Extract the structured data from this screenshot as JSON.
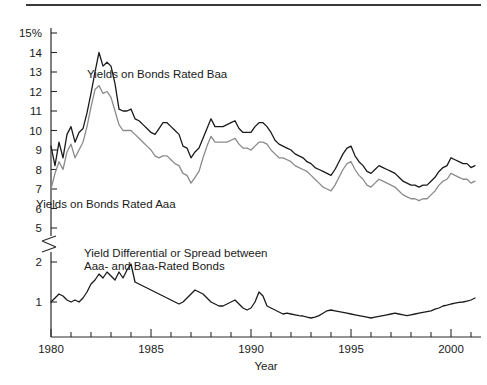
{
  "chart_data": {
    "type": "line",
    "title": "",
    "xlabel": "Year",
    "ylabel": "",
    "grid": false,
    "legend_position": "inline-annotations",
    "x_ticks_labeled": [
      "1980",
      "1985",
      "1990",
      "1995",
      "2000"
    ],
    "x_tick_values": [
      1980,
      1985,
      1990,
      1995,
      2000
    ],
    "xlim": [
      1980,
      2001.5
    ],
    "x_minor_ticks_every": 1,
    "y_upper_ticks": [
      "15%",
      "14",
      "13",
      "12",
      "11",
      "10",
      "9",
      "8",
      "7",
      "6",
      "5"
    ],
    "y_upper_tick_values": [
      15,
      14,
      13,
      12,
      11,
      10,
      9,
      8,
      7,
      6,
      5
    ],
    "y_lower_ticks": [
      "2",
      "1"
    ],
    "y_lower_tick_values": [
      2,
      1
    ],
    "axis_break": true,
    "axis_break_note": "y-axis broken between 5 and 2",
    "ylim_upper": [
      5,
      15
    ],
    "ylim_lower": [
      0,
      2.3
    ],
    "annotations": [
      {
        "id": "baa-label",
        "text": "Yields on Bonds Rated Baa",
        "x": 87,
        "y": 78
      },
      {
        "id": "aaa-label",
        "text": "Yields on Bonds Rated Aaa",
        "x": 36,
        "y": 208
      },
      {
        "id": "spread-label-line1",
        "text": "Yield Differential or Spread between",
        "x": 84,
        "y": 257
      },
      {
        "id": "spread-label-line2",
        "text": "Aaa- and Baa-Rated Bonds",
        "x": 84,
        "y": 270
      }
    ],
    "colors": {
      "baa": "#1a1a1a",
      "aaa": "#8a8a8a",
      "spread": "#1a1a1a",
      "axis": "#2b2b2b",
      "background": "#ffffff"
    },
    "series": [
      {
        "name": "Yields on Bonds Rated Baa",
        "color": "#1a1a1a",
        "axis": "upper",
        "x": [
          1980.0,
          1980.2,
          1980.4,
          1980.6,
          1980.8,
          1981.0,
          1981.2,
          1981.4,
          1981.6,
          1981.8,
          1982.0,
          1982.2,
          1982.4,
          1982.6,
          1982.8,
          1983.0,
          1983.2,
          1983.4,
          1983.6,
          1983.8,
          1984.0,
          1984.2,
          1984.4,
          1984.6,
          1984.8,
          1985.0,
          1985.2,
          1985.4,
          1985.6,
          1985.8,
          1986.0,
          1986.2,
          1986.4,
          1986.6,
          1986.8,
          1987.0,
          1987.2,
          1987.4,
          1987.6,
          1987.8,
          1988.0,
          1988.2,
          1988.4,
          1988.6,
          1988.8,
          1989.0,
          1989.2,
          1989.4,
          1989.6,
          1989.8,
          1990.0,
          1990.2,
          1990.4,
          1990.6,
          1990.8,
          1991.0,
          1991.2,
          1991.4,
          1991.6,
          1991.8,
          1992.0,
          1992.2,
          1992.4,
          1992.6,
          1992.8,
          1993.0,
          1993.2,
          1993.4,
          1993.6,
          1993.8,
          1994.0,
          1994.2,
          1994.4,
          1994.6,
          1994.8,
          1995.0,
          1995.2,
          1995.4,
          1995.6,
          1995.8,
          1996.0,
          1996.2,
          1996.4,
          1996.6,
          1996.8,
          1997.0,
          1997.2,
          1997.4,
          1997.6,
          1997.8,
          1998.0,
          1998.2,
          1998.4,
          1998.6,
          1998.8,
          1999.0,
          1999.2,
          1999.4,
          1999.6,
          1999.8,
          2000.0,
          2000.2,
          2000.4,
          2000.6,
          2000.8,
          2001.0,
          2001.2
        ],
        "y": [
          9.2,
          8.2,
          9.4,
          8.6,
          9.8,
          10.2,
          9.4,
          9.9,
          10.1,
          10.9,
          11.9,
          13.0,
          14.0,
          13.3,
          13.5,
          13.3,
          12.4,
          11.1,
          11.0,
          11.0,
          11.1,
          10.6,
          10.5,
          10.3,
          10.1,
          9.9,
          9.8,
          10.1,
          10.4,
          10.4,
          10.2,
          10.0,
          9.8,
          9.2,
          9.1,
          8.6,
          8.9,
          9.1,
          9.6,
          10.1,
          10.6,
          10.2,
          10.2,
          10.2,
          10.3,
          10.4,
          10.5,
          10.1,
          9.9,
          9.9,
          9.9,
          10.2,
          10.4,
          10.4,
          10.2,
          9.9,
          9.5,
          9.3,
          9.2,
          9.1,
          9.0,
          8.8,
          8.7,
          8.6,
          8.4,
          8.3,
          8.1,
          8.0,
          7.9,
          7.8,
          7.7,
          8.0,
          8.4,
          8.8,
          9.1,
          9.2,
          8.7,
          8.4,
          8.2,
          7.9,
          7.8,
          8.0,
          8.2,
          8.1,
          8.0,
          7.9,
          7.8,
          7.6,
          7.4,
          7.3,
          7.2,
          7.2,
          7.1,
          7.2,
          7.2,
          7.4,
          7.6,
          7.9,
          8.1,
          8.2,
          8.6,
          8.5,
          8.4,
          8.3,
          8.3,
          8.1,
          8.2
        ],
        "unit": "percent"
      },
      {
        "name": "Yields on Bonds Rated Aaa",
        "color": "#8a8a8a",
        "axis": "upper",
        "x": [
          1980.0,
          1980.2,
          1980.4,
          1980.6,
          1980.8,
          1981.0,
          1981.2,
          1981.4,
          1981.6,
          1981.8,
          1982.0,
          1982.2,
          1982.4,
          1982.6,
          1982.8,
          1983.0,
          1983.2,
          1983.4,
          1983.6,
          1983.8,
          1984.0,
          1984.2,
          1984.4,
          1984.6,
          1984.8,
          1985.0,
          1985.2,
          1985.4,
          1985.6,
          1985.8,
          1986.0,
          1986.2,
          1986.4,
          1986.6,
          1986.8,
          1987.0,
          1987.2,
          1987.4,
          1987.6,
          1987.8,
          1988.0,
          1988.2,
          1988.4,
          1988.6,
          1988.8,
          1989.0,
          1989.2,
          1989.4,
          1989.6,
          1989.8,
          1990.0,
          1990.2,
          1990.4,
          1990.6,
          1990.8,
          1991.0,
          1991.2,
          1991.4,
          1991.6,
          1991.8,
          1992.0,
          1992.2,
          1992.4,
          1992.6,
          1992.8,
          1993.0,
          1993.2,
          1993.4,
          1993.6,
          1993.8,
          1994.0,
          1994.2,
          1994.4,
          1994.6,
          1994.8,
          1995.0,
          1995.2,
          1995.4,
          1995.6,
          1995.8,
          1996.0,
          1996.2,
          1996.4,
          1996.6,
          1996.8,
          1997.0,
          1997.2,
          1997.4,
          1997.6,
          1997.8,
          1998.0,
          1998.2,
          1998.4,
          1998.6,
          1998.8,
          1999.0,
          1999.2,
          1999.4,
          1999.6,
          1999.8,
          2000.0,
          2000.2,
          2000.4,
          2000.6,
          2000.8,
          2001.0,
          2001.2
        ],
        "y": [
          7.0,
          7.8,
          8.4,
          8.0,
          8.9,
          9.3,
          8.6,
          9.0,
          9.4,
          10.2,
          11.2,
          12.1,
          12.3,
          11.9,
          12.0,
          11.7,
          11.0,
          10.3,
          10.0,
          10.0,
          10.0,
          9.8,
          9.6,
          9.4,
          9.2,
          9.0,
          8.7,
          8.6,
          8.7,
          8.7,
          8.5,
          8.3,
          8.2,
          7.8,
          7.7,
          7.3,
          7.6,
          7.9,
          8.6,
          9.2,
          9.7,
          9.4,
          9.4,
          9.4,
          9.4,
          9.5,
          9.6,
          9.3,
          9.1,
          9.1,
          9.0,
          9.2,
          9.4,
          9.4,
          9.3,
          9.0,
          8.8,
          8.6,
          8.6,
          8.5,
          8.4,
          8.2,
          8.1,
          8.0,
          7.9,
          7.7,
          7.5,
          7.3,
          7.1,
          7.0,
          6.9,
          7.2,
          7.6,
          8.0,
          8.3,
          8.4,
          8.0,
          7.7,
          7.5,
          7.2,
          7.1,
          7.3,
          7.5,
          7.4,
          7.3,
          7.2,
          7.1,
          6.9,
          6.7,
          6.6,
          6.5,
          6.5,
          6.4,
          6.5,
          6.5,
          6.7,
          6.9,
          7.2,
          7.4,
          7.5,
          7.8,
          7.7,
          7.6,
          7.5,
          7.5,
          7.3,
          7.4
        ],
        "unit": "percent"
      },
      {
        "name": "Yield Differential or Spread between Aaa- and Baa-Rated Bonds",
        "color": "#1a1a1a",
        "axis": "lower",
        "x": [
          1980.0,
          1980.2,
          1980.4,
          1980.6,
          1980.8,
          1981.0,
          1981.2,
          1981.4,
          1981.6,
          1981.8,
          1982.0,
          1982.2,
          1982.4,
          1982.6,
          1982.8,
          1983.0,
          1983.2,
          1983.4,
          1983.6,
          1983.8,
          1984.0,
          1984.2,
          1984.4,
          1984.6,
          1984.8,
          1985.0,
          1985.2,
          1985.4,
          1985.6,
          1985.8,
          1986.0,
          1986.2,
          1986.4,
          1986.6,
          1986.8,
          1987.0,
          1987.2,
          1987.4,
          1987.6,
          1987.8,
          1988.0,
          1988.2,
          1988.4,
          1988.6,
          1988.8,
          1989.0,
          1989.2,
          1989.4,
          1989.6,
          1989.8,
          1990.0,
          1990.2,
          1990.4,
          1990.6,
          1990.8,
          1991.0,
          1991.2,
          1991.4,
          1991.6,
          1991.8,
          1992.0,
          1992.2,
          1992.4,
          1992.6,
          1992.8,
          1993.0,
          1993.2,
          1993.4,
          1993.6,
          1993.8,
          1994.0,
          1994.2,
          1994.4,
          1994.6,
          1994.8,
          1995.0,
          1995.2,
          1995.4,
          1995.6,
          1995.8,
          1996.0,
          1996.2,
          1996.4,
          1996.6,
          1996.8,
          1997.0,
          1997.2,
          1997.4,
          1997.6,
          1997.8,
          1998.0,
          1998.2,
          1998.4,
          1998.6,
          1998.8,
          1999.0,
          1999.2,
          1999.4,
          1999.6,
          1999.8,
          2000.0,
          2000.2,
          2000.4,
          2000.6,
          2000.8,
          2001.0,
          2001.2
        ],
        "y": [
          1.0,
          1.1,
          1.2,
          1.15,
          1.05,
          1.0,
          1.05,
          1.0,
          1.1,
          1.25,
          1.45,
          1.55,
          1.7,
          1.6,
          1.75,
          1.65,
          1.55,
          1.75,
          1.6,
          1.8,
          1.95,
          1.5,
          1.45,
          1.4,
          1.35,
          1.3,
          1.25,
          1.2,
          1.15,
          1.1,
          1.05,
          1.0,
          0.95,
          1.0,
          1.1,
          1.2,
          1.3,
          1.25,
          1.2,
          1.1,
          1.0,
          0.95,
          0.9,
          0.9,
          0.95,
          1.0,
          1.05,
          0.95,
          0.85,
          0.8,
          0.85,
          1.0,
          1.25,
          1.15,
          0.9,
          0.85,
          0.8,
          0.75,
          0.7,
          0.72,
          0.7,
          0.68,
          0.66,
          0.65,
          0.62,
          0.6,
          0.62,
          0.66,
          0.72,
          0.78,
          0.8,
          0.78,
          0.76,
          0.74,
          0.72,
          0.7,
          0.68,
          0.66,
          0.64,
          0.62,
          0.6,
          0.62,
          0.64,
          0.66,
          0.68,
          0.7,
          0.72,
          0.7,
          0.68,
          0.66,
          0.68,
          0.7,
          0.72,
          0.74,
          0.76,
          0.78,
          0.82,
          0.85,
          0.9,
          0.92,
          0.95,
          0.97,
          0.99,
          1.0,
          1.02,
          1.05,
          1.1
        ],
        "unit": "percentage points"
      }
    ]
  }
}
